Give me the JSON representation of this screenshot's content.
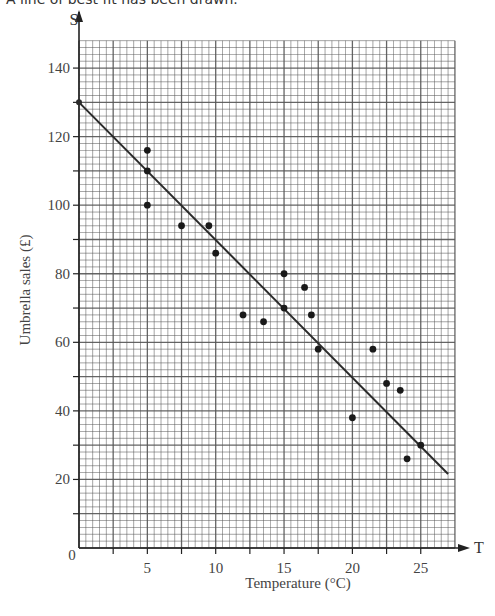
{
  "caption": "A line of best fit has been drawn.",
  "chart_data": {
    "type": "scatter",
    "title": "",
    "xlabel": "Temperature (°C)",
    "ylabel": "Umbrella sales (£)",
    "x_axis_letter": "T",
    "y_axis_letter": "S",
    "xlim": [
      0,
      27.5
    ],
    "ylim": [
      0,
      148
    ],
    "x_ticks": [
      0,
      5,
      10,
      15,
      20,
      25
    ],
    "y_ticks": [
      0,
      20,
      40,
      60,
      80,
      100,
      120,
      140
    ],
    "x_tick_labels": [
      "0",
      "5",
      "10",
      "15",
      "20",
      "25"
    ],
    "y_tick_labels": [
      "20",
      "40",
      "60",
      "80",
      "100",
      "120",
      "140"
    ],
    "grid": true,
    "grid_minor_step": {
      "x": 0.5,
      "y": 2
    },
    "grid_major_step": {
      "x": 2.5,
      "y": 10
    },
    "points": [
      {
        "x": 5,
        "y": 116
      },
      {
        "x": 5,
        "y": 110
      },
      {
        "x": 5,
        "y": 100
      },
      {
        "x": 7.5,
        "y": 94
      },
      {
        "x": 9.5,
        "y": 94
      },
      {
        "x": 10,
        "y": 86
      },
      {
        "x": 12,
        "y": 68
      },
      {
        "x": 13.5,
        "y": 66
      },
      {
        "x": 15,
        "y": 80
      },
      {
        "x": 15,
        "y": 70
      },
      {
        "x": 16.5,
        "y": 76
      },
      {
        "x": 17,
        "y": 68
      },
      {
        "x": 17.5,
        "y": 58
      },
      {
        "x": 20,
        "y": 38
      },
      {
        "x": 21.5,
        "y": 58
      },
      {
        "x": 22.5,
        "y": 48
      },
      {
        "x": 23.5,
        "y": 46
      },
      {
        "x": 24,
        "y": 26
      },
      {
        "x": 25,
        "y": 30
      }
    ],
    "line_of_best_fit": {
      "x1": 0,
      "y1": 130,
      "x2": 27,
      "y2": 21.6
    }
  },
  "colors": {
    "grid": "#555555",
    "axis": "#222222",
    "point": "#1a1a1a",
    "line": "#2a2a2a",
    "text": "#444444"
  }
}
